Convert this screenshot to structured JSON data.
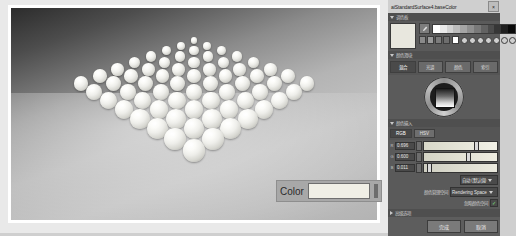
{
  "window": {
    "title": "aiStandardSurface4.baseColor",
    "close_label": "×"
  },
  "viewport": {
    "color_attr": {
      "label": "Color",
      "swatch_color": "#f0efe6"
    },
    "render": {
      "description": "3D render of a grid of white spheres on a gray floor",
      "sphere_grid_rows": 8,
      "sphere_grid_cols": 8,
      "sphere_color": "#f7f6f0",
      "floor_top_color": "#2c2c2c",
      "floor_bottom_color": "#b3b3b3"
    }
  },
  "sections": {
    "palette": {
      "title": "调色板",
      "preview_color": "#e8e7de",
      "eyedropper_icon": "eyedropper-icon",
      "gray_ramp": [
        "#ffffff",
        "#e8e8e8",
        "#d2d2d2",
        "#bcbcbc",
        "#a5a5a5",
        "#8f8f8f",
        "#797979",
        "#626262",
        "#4c4c4c",
        "#363636",
        "#1f1f1f",
        "#0a0a0a"
      ],
      "swatch_small": [
        "#8a8a8a",
        "#9a9a9a",
        "#7c7c7c",
        "#6e6e6e"
      ],
      "swatch_white": "#ffffff",
      "dot_swatches": [
        "#cfcfcf",
        "#cfcfcf",
        "#cfcfcf",
        "#cfcfcf",
        "#cfcfcf",
        "#cfcfcf",
        "#cfcfcf"
      ]
    },
    "wheel": {
      "title": "颜色滑块",
      "tabs": [
        {
          "label": "混合",
          "active": true
        },
        {
          "label": "光谱",
          "active": false
        },
        {
          "label": "颜色",
          "active": false
        },
        {
          "label": "索引",
          "active": false
        }
      ],
      "wheel_icon": "color-wheel-icon"
    },
    "values": {
      "title": "颜色输入",
      "mode_tabs": [
        {
          "label": "RGB",
          "active": true
        },
        {
          "label": "HSV",
          "active": false
        }
      ],
      "channels": [
        {
          "label": "R",
          "value": "0.696",
          "slider_pct": 70,
          "track_start": "#d8d8c9",
          "track_end": "#f2f1e6"
        },
        {
          "label": "G",
          "value": "0.600",
          "slider_pct": 60,
          "track_start": "#d4d4c6",
          "track_end": "#efeee2"
        },
        {
          "label": "B",
          "value": "0.011",
          "slider_pct": 6,
          "track_start": "#cfcfc2",
          "track_end": "#ebeade"
        }
      ],
      "color_space_row": {
        "label": "",
        "combo_value": "自动 (默认值)"
      },
      "rendering_row": {
        "label": "颜色管理空间",
        "combo_value": "Rendering Space"
      },
      "checkbox_row": {
        "label": "忽略颜色空间",
        "checked": true,
        "check_glyph": "✓"
      }
    },
    "advanced": {
      "title": "高级选项"
    }
  },
  "buttons": [
    {
      "label": "完成",
      "name": "done-button"
    },
    {
      "label": "取消",
      "name": "cancel-button"
    }
  ]
}
